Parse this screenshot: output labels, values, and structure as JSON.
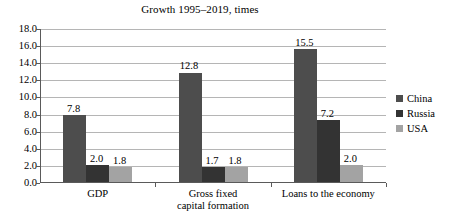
{
  "chart_data": {
    "type": "bar",
    "title": "Growth 1995–2019, times",
    "xlabel": "",
    "ylabel": "",
    "ylim": [
      0,
      18
    ],
    "ytick_step": 2,
    "yticks": [
      "18.0",
      "16.0",
      "14.0",
      "12.0",
      "10.0",
      "8.0",
      "6.0",
      "4.0",
      "2.0",
      "0.0"
    ],
    "grid": true,
    "legend_position": "right",
    "categories": [
      "GDP",
      "Gross fixed\ncapital formation",
      "Loans to the economy"
    ],
    "series": [
      {
        "name": "China",
        "color": "#4d4d4d",
        "values": [
          7.8,
          12.8,
          15.5
        ],
        "labels": [
          "7.8",
          "12.8",
          "15.5"
        ]
      },
      {
        "name": "Russia",
        "color": "#333333",
        "values": [
          2.0,
          1.7,
          7.2
        ],
        "labels": [
          "2.0",
          "1.7",
          "7.2"
        ]
      },
      {
        "name": "USA",
        "color": "#a3a3a3",
        "values": [
          1.8,
          1.8,
          2.0
        ],
        "labels": [
          "1.8",
          "1.8",
          "2.0"
        ]
      }
    ]
  }
}
